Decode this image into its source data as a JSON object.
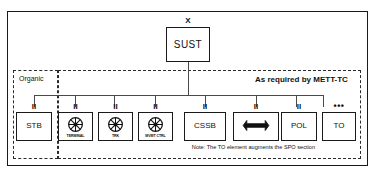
{
  "diagram": {
    "root": {
      "label": "SUST",
      "echelon": "X",
      "name": "sust-box"
    },
    "regions": [
      {
        "id": "organic",
        "label": "Organic"
      },
      {
        "id": "mett",
        "label": "As required by METT-TC"
      }
    ],
    "nodes": [
      {
        "id": "stb",
        "label": "STB",
        "echelon": "II",
        "icon": "none",
        "sub_label": "",
        "region": "organic",
        "thick": false
      },
      {
        "id": "terminal",
        "label": "",
        "echelon": "II",
        "icon": "wheel-icon",
        "sub_label": "TERMINAL",
        "region": "mett",
        "thick": false
      },
      {
        "id": "trk",
        "label": "",
        "echelon": "II",
        "icon": "wheel-icon",
        "sub_label": "TRK",
        "region": "mett",
        "thick": false
      },
      {
        "id": "mvmt-ctrl",
        "label": "",
        "echelon": "II",
        "icon": "wheel-icon",
        "sub_label": "MVMT CTRL",
        "region": "mett",
        "thick": false
      },
      {
        "id": "cssb",
        "label": "CSSB",
        "echelon": "II",
        "icon": "none",
        "sub_label": "",
        "region": "mett",
        "thick": false
      },
      {
        "id": "maintenance",
        "label": "",
        "echelon": "II",
        "icon": "wrench-icon",
        "sub_label": "",
        "region": "mett",
        "thick": true
      },
      {
        "id": "pol",
        "label": "POL",
        "echelon": "II",
        "icon": "none",
        "sub_label": "",
        "region": "mett",
        "thick": false
      },
      {
        "id": "to",
        "label": "TO",
        "echelon": "•••",
        "icon": "none",
        "sub_label": "",
        "region": "mett",
        "thick": false
      }
    ],
    "note": "Note: The TO element augments the SPO section",
    "colors": {
      "line": "#4a4a4a",
      "border": "#1a1a1a",
      "text": "#111111",
      "background": "#ffffff"
    }
  }
}
